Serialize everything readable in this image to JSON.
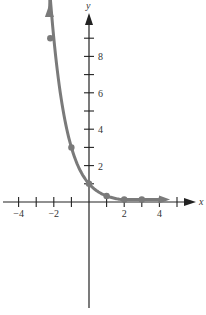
{
  "chart_data": {
    "type": "line",
    "title": "",
    "xlabel": "x",
    "ylabel": "y",
    "function": "y = (1/3)^x",
    "xlim": [
      -4.8,
      5.8
    ],
    "ylim": [
      -5.8,
      10.8
    ],
    "grid": false,
    "legend": null,
    "x_ticks": [
      -4,
      -3,
      -2,
      -1,
      1,
      2,
      3,
      4,
      5
    ],
    "x_tick_labels": [
      {
        "value": -4,
        "label": "−4"
      },
      {
        "value": -2,
        "label": "−2"
      },
      {
        "value": 2,
        "label": "2"
      },
      {
        "value": 4,
        "label": "4"
      }
    ],
    "y_ticks": [
      1,
      2,
      3,
      4,
      5,
      6,
      7,
      8,
      9
    ],
    "y_tick_labels": [
      {
        "value": 2,
        "label": "2"
      },
      {
        "value": 4,
        "label": "4"
      },
      {
        "value": 6,
        "label": "6"
      },
      {
        "value": 8,
        "label": "8"
      }
    ],
    "series": [
      {
        "name": "y = (1/3)^x",
        "points": [
          {
            "x": -2,
            "y": 9
          },
          {
            "x": -1,
            "y": 3
          },
          {
            "x": 0,
            "y": 1
          },
          {
            "x": 1,
            "y": 0.333
          },
          {
            "x": 2,
            "y": 0.111
          },
          {
            "x": 3,
            "y": 0.037
          }
        ],
        "x": [
          -2,
          -1,
          0,
          1,
          2,
          3
        ],
        "values": [
          9,
          3,
          1,
          0.333,
          0.111,
          0.037
        ],
        "color": "#7a7a7a",
        "markers": true,
        "arrows_at_ends": true
      }
    ]
  },
  "colors": {
    "axis": "#222222",
    "curve": "#7a7a7a",
    "background": "#ffffff"
  }
}
